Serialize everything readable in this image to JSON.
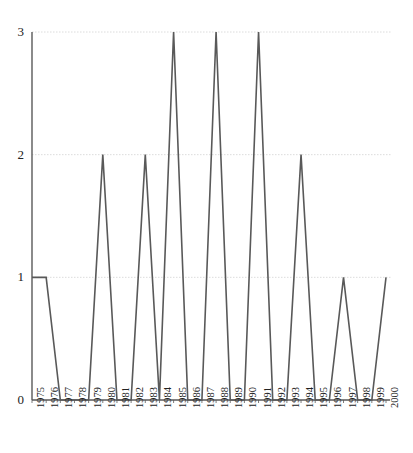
{
  "chart_data": {
    "type": "line",
    "title": "",
    "xlabel": "",
    "ylabel": "",
    "categories": [
      "1975",
      "1976",
      "1977",
      "1978",
      "1979",
      "1980",
      "1981",
      "1982",
      "1983",
      "1984",
      "1985",
      "1986",
      "1987",
      "1988",
      "1989",
      "1990",
      "1991",
      "1992",
      "1993",
      "1994",
      "1995",
      "1996",
      "1997",
      "1998",
      "1999",
      "2000"
    ],
    "values": [
      1,
      1,
      0,
      0,
      0,
      2,
      0,
      0,
      2,
      0,
      3,
      0,
      0,
      3,
      0,
      0,
      3,
      0,
      0,
      2,
      0,
      0,
      1,
      0,
      0,
      1
    ],
    "series": [
      {
        "name": "count",
        "values": [
          1,
          1,
          0,
          0,
          0,
          2,
          0,
          0,
          2,
          0,
          3,
          0,
          0,
          3,
          0,
          0,
          3,
          0,
          0,
          2,
          0,
          0,
          1,
          0,
          0,
          1
        ]
      }
    ],
    "x_tick_labels": [
      "1975",
      "1976",
      "1977",
      "1978",
      "1979",
      "1980",
      "1981",
      "1982",
      "1983",
      "1984",
      "1985",
      "1986",
      "1987",
      "1988",
      "1989",
      "1990",
      "1991",
      "1992",
      "1993",
      "1994",
      "1995",
      "1996",
      "1997",
      "1998",
      "1999",
      "2000"
    ],
    "y_tick_labels": [
      "0",
      "1",
      "2",
      "3"
    ],
    "y_tick_values": [
      0,
      1,
      2,
      3
    ],
    "ylim": [
      0,
      3
    ],
    "xlim": [
      "1975",
      "2000"
    ],
    "grid": true,
    "grid_axis": "y",
    "legend": false,
    "legend_position": "none",
    "line_color": "#595959",
    "grid_color": "#d8d8d8",
    "axis_color": "#595959",
    "background_color": "#ffffff",
    "line_width": 1.6,
    "markers": false
  },
  "axes": {
    "y_ticks": [
      {
        "label": "3",
        "value": 3
      },
      {
        "label": "2",
        "value": 2
      },
      {
        "label": "1",
        "value": 1
      },
      {
        "label": "0",
        "value": 0
      }
    ]
  }
}
